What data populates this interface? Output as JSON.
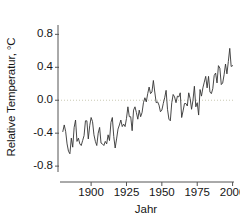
{
  "chart_data": {
    "type": "line",
    "title": "",
    "subtitle": "",
    "xlabel": "Jahr",
    "ylabel": "Relative Temperatur, °C",
    "xlim": [
      1878,
      2001
    ],
    "ylim": [
      -0.92,
      0.95
    ],
    "xticks": [
      1900,
      1925,
      1950,
      1975,
      2000
    ],
    "xticklabels": [
      "1900",
      "1925",
      "1950",
      "1975",
      "2000"
    ],
    "yticks": [
      -0.8,
      -0.4,
      0.0,
      0.4,
      0.8
    ],
    "yticklabels": [
      "-0.8",
      "-0.4",
      "0.0",
      "0.4",
      "0.8"
    ],
    "grid": false,
    "zero_reference_line": 0.0,
    "zero_reference_style": "dotted",
    "legend": null,
    "line_color": "#333333",
    "axis_color": "#555555",
    "gridline_color": "#c8c8b4",
    "background_color": "#ffffff",
    "series": [
      {
        "name": "Relative Temperatur",
        "x": [
          1880,
          1881,
          1882,
          1883,
          1884,
          1885,
          1886,
          1887,
          1888,
          1889,
          1890,
          1891,
          1892,
          1893,
          1894,
          1895,
          1896,
          1897,
          1898,
          1899,
          1900,
          1901,
          1902,
          1903,
          1904,
          1905,
          1906,
          1907,
          1908,
          1909,
          1910,
          1911,
          1912,
          1913,
          1914,
          1915,
          1916,
          1917,
          1918,
          1919,
          1920,
          1921,
          1922,
          1923,
          1924,
          1925,
          1926,
          1927,
          1928,
          1929,
          1930,
          1931,
          1932,
          1933,
          1934,
          1935,
          1936,
          1937,
          1938,
          1939,
          1940,
          1941,
          1942,
          1943,
          1944,
          1945,
          1946,
          1947,
          1948,
          1949,
          1950,
          1951,
          1952,
          1953,
          1954,
          1955,
          1956,
          1957,
          1958,
          1959,
          1960,
          1961,
          1962,
          1963,
          1964,
          1965,
          1966,
          1967,
          1968,
          1969,
          1970,
          1971,
          1972,
          1973,
          1974,
          1975,
          1976,
          1977,
          1978,
          1979,
          1980,
          1981,
          1982,
          1983,
          1984,
          1985,
          1986,
          1987,
          1988,
          1989,
          1990,
          1991,
          1992,
          1993,
          1994,
          1995,
          1996,
          1997,
          1998,
          1999,
          2000
        ],
        "y": [
          -0.38,
          -0.3,
          -0.38,
          -0.53,
          -0.62,
          -0.65,
          -0.46,
          -0.57,
          -0.33,
          -0.24,
          -0.5,
          -0.46,
          -0.53,
          -0.55,
          -0.49,
          -0.43,
          -0.25,
          -0.25,
          -0.47,
          -0.31,
          -0.21,
          -0.26,
          -0.42,
          -0.5,
          -0.55,
          -0.4,
          -0.33,
          -0.52,
          -0.53,
          -0.55,
          -0.5,
          -0.53,
          -0.42,
          -0.49,
          -0.27,
          -0.21,
          -0.44,
          -0.58,
          -0.47,
          -0.35,
          -0.3,
          -0.24,
          -0.32,
          -0.29,
          -0.32,
          -0.22,
          -0.08,
          -0.2,
          -0.2,
          -0.37,
          -0.12,
          -0.08,
          -0.15,
          -0.23,
          -0.12,
          -0.2,
          -0.15,
          -0.03,
          0.03,
          -0.02,
          0.08,
          0.16,
          0.08,
          0.1,
          0.24,
          0.1,
          -0.03,
          -0.02,
          -0.06,
          -0.14,
          -0.12,
          -0.04,
          0.03,
          0.12,
          -0.11,
          -0.23,
          -0.25,
          -0.03,
          0.07,
          0.04,
          -0.03,
          0.05,
          0.04,
          0.09,
          -0.21,
          -0.13,
          -0.04,
          -0.04,
          -0.07,
          0.09,
          0.02,
          -0.11,
          -0.0,
          0.17,
          -0.08,
          -0.03,
          -0.18,
          0.13,
          0.05,
          0.15,
          0.22,
          0.29,
          0.15,
          0.29,
          0.1,
          0.08,
          0.14,
          0.3,
          0.33,
          0.21,
          0.42,
          0.39,
          0.19,
          0.21,
          0.31,
          0.44,
          0.32,
          0.47,
          0.63,
          0.41,
          0.42
        ],
        "y_min": -0.65,
        "y_max": 0.85,
        "units": "°C"
      }
    ]
  },
  "axis_titles": {
    "x": "Jahr",
    "y": "Relative Temperatur, °C"
  }
}
